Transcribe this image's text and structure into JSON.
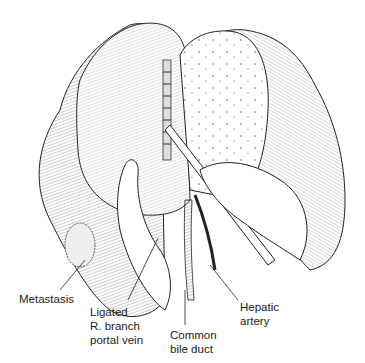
{
  "figure": {
    "labels": {
      "metastasis": "Metastasis",
      "portal_vein": "Ligated\nR. branch\nportal vein",
      "bile_duct": "Common\nbile duct",
      "hepatic_artery": "Hepatic\nartery"
    }
  }
}
